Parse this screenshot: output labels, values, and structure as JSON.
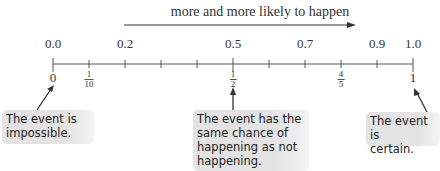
{
  "header": {
    "label": "more and more likely to happen"
  },
  "number_line": {
    "min": 0.0,
    "max": 1.0,
    "tick_count": 11,
    "decimal_labels": [
      {
        "value": 0.0,
        "text": "0.0"
      },
      {
        "value": 0.2,
        "text": "0.2"
      },
      {
        "value": 0.5,
        "text": "0.5"
      },
      {
        "value": 0.7,
        "text": "0.7"
      },
      {
        "value": 0.9,
        "text": "0.9"
      },
      {
        "value": 1.0,
        "text": "1.0"
      }
    ],
    "fraction_labels": [
      {
        "value": 0.0,
        "whole": "0"
      },
      {
        "value": 0.1,
        "numerator": "1",
        "denominator": "10"
      },
      {
        "value": 0.5,
        "numerator": "1",
        "denominator": "2"
      },
      {
        "value": 0.8,
        "numerator": "4",
        "denominator": "5"
      },
      {
        "value": 1.0,
        "whole": "1"
      }
    ]
  },
  "callouts": [
    {
      "points_to": "0",
      "text_line1": "The event is",
      "text_line2": "impossible."
    },
    {
      "points_to": "1/2",
      "text_line1": "The event has the",
      "text_line2": "same chance of",
      "text_line3": "happening as not",
      "text_line4": "happening."
    },
    {
      "points_to": "1",
      "text_line1": "The event is",
      "text_line2": "certain."
    }
  ],
  "colors": {
    "line": "#555555",
    "callout_bg": "#e3e3e3",
    "text": "#333333"
  }
}
